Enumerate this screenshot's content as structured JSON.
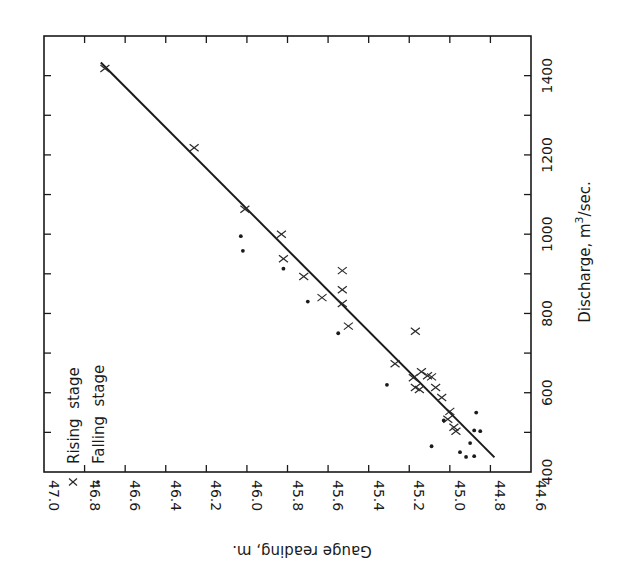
{
  "chart_data": {
    "type": "scatter",
    "orientation": "rotated-90",
    "title": "",
    "xlabel": "Discharge, m³/sec.",
    "ylabel": "Gauge reading, m.",
    "discharge_axis": {
      "label": "Discharge, m",
      "label_sup": "3",
      "label_suffix": "/sec.",
      "range": [
        400,
        1500
      ],
      "ticks": [
        400,
        600,
        800,
        1000,
        1200,
        1400
      ],
      "tick_labels": [
        "400",
        "600",
        "800",
        "1000",
        "1200",
        "1400"
      ],
      "minor_ticks": [
        500,
        700,
        900,
        1100,
        1300
      ]
    },
    "gauge_axis": {
      "label": "Gauge reading, m.",
      "range": [
        44.6,
        47.0
      ],
      "ticks": [
        47.0,
        46.8,
        46.6,
        46.4,
        46.2,
        46.0,
        45.8,
        45.6,
        45.4,
        45.2,
        45.0,
        44.8,
        44.6
      ],
      "tick_labels": [
        "47.0",
        "46.8",
        "46.6",
        "46.4",
        "46.2",
        "46.0",
        "45.8",
        "45.6",
        "45.4",
        "45.2",
        "45.0",
        "44.8",
        "44.6"
      ]
    },
    "grid": false,
    "legend": {
      "position": "upper-left (rotated)",
      "entries": [
        {
          "marker": "x",
          "label": "Rising  stage"
        },
        {
          "marker": "•",
          "label": "Falling  stage"
        }
      ]
    },
    "series": [
      {
        "name": "Rising stage",
        "marker": "x",
        "points": [
          {
            "discharge": 1418,
            "gauge": 46.7
          },
          {
            "discharge": 1218,
            "gauge": 46.26
          },
          {
            "discharge": 1063,
            "gauge": 46.01
          },
          {
            "discharge": 1000,
            "gauge": 45.83
          },
          {
            "discharge": 938,
            "gauge": 45.82
          },
          {
            "discharge": 908,
            "gauge": 45.53
          },
          {
            "discharge": 893,
            "gauge": 45.72
          },
          {
            "discharge": 860,
            "gauge": 45.53
          },
          {
            "discharge": 840,
            "gauge": 45.63
          },
          {
            "discharge": 825,
            "gauge": 45.53
          },
          {
            "discharge": 768,
            "gauge": 45.5
          },
          {
            "discharge": 755,
            "gauge": 45.17
          },
          {
            "discharge": 673,
            "gauge": 45.27
          },
          {
            "discharge": 653,
            "gauge": 45.14
          },
          {
            "discharge": 643,
            "gauge": 45.11
          },
          {
            "discharge": 640,
            "gauge": 45.09
          },
          {
            "discharge": 638,
            "gauge": 45.18
          },
          {
            "discharge": 613,
            "gauge": 45.17
          },
          {
            "discharge": 613,
            "gauge": 45.07
          },
          {
            "discharge": 608,
            "gauge": 45.15
          },
          {
            "discharge": 588,
            "gauge": 45.04
          },
          {
            "discharge": 553,
            "gauge": 45.0
          },
          {
            "discharge": 533,
            "gauge": 45.01
          },
          {
            "discharge": 513,
            "gauge": 44.98
          },
          {
            "discharge": 503,
            "gauge": 44.97
          }
        ]
      },
      {
        "name": "Falling stage",
        "marker": "dot",
        "points": [
          {
            "discharge": 995,
            "gauge": 46.03
          },
          {
            "discharge": 958,
            "gauge": 46.02
          },
          {
            "discharge": 913,
            "gauge": 45.82
          },
          {
            "discharge": 830,
            "gauge": 45.7
          },
          {
            "discharge": 750,
            "gauge": 45.55
          },
          {
            "discharge": 620,
            "gauge": 45.31
          },
          {
            "discharge": 550,
            "gauge": 44.87
          },
          {
            "discharge": 530,
            "gauge": 45.03
          },
          {
            "discharge": 505,
            "gauge": 44.88
          },
          {
            "discharge": 503,
            "gauge": 44.85
          },
          {
            "discharge": 473,
            "gauge": 44.9
          },
          {
            "discharge": 465,
            "gauge": 45.09
          },
          {
            "discharge": 450,
            "gauge": 44.95
          },
          {
            "discharge": 440,
            "gauge": 44.88
          },
          {
            "discharge": 438,
            "gauge": 44.92
          }
        ]
      }
    ],
    "fit_line": {
      "name": "Rating curve",
      "from": {
        "discharge": 1433,
        "gauge": 46.72
      },
      "to": {
        "discharge": 437,
        "gauge": 44.78
      }
    }
  }
}
